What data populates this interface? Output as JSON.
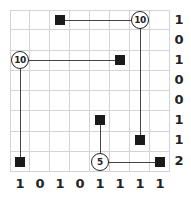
{
  "puzzle": {
    "grid_size": {
      "rows": 8,
      "cols": 8
    },
    "circles": [
      {
        "row": 0,
        "col": 6,
        "value": "10"
      },
      {
        "row": 2,
        "col": 0,
        "value": "10"
      },
      {
        "row": 7,
        "col": 4,
        "value": "5"
      }
    ],
    "squares": [
      {
        "row": 0,
        "col": 2
      },
      {
        "row": 2,
        "col": 5
      },
      {
        "row": 5,
        "col": 4
      },
      {
        "row": 6,
        "col": 6
      },
      {
        "row": 7,
        "col": 0
      },
      {
        "row": 7,
        "col": 7
      }
    ],
    "row_clues": [
      "1",
      "0",
      "1",
      "0",
      "0",
      "1",
      "1",
      "2"
    ],
    "col_clues": [
      "1",
      "0",
      "1",
      "0",
      "1",
      "1",
      "1",
      "1"
    ]
  }
}
